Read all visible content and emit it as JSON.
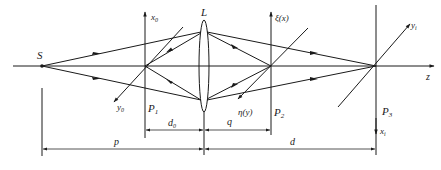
{
  "figure": {
    "labels": {
      "source": "S",
      "lens": "L",
      "optical_axis": "z",
      "p1_plane": "P",
      "p1_sub": "1",
      "p2_plane": "P",
      "p2_sub": "2",
      "p3_plane": "P",
      "p3_sub": "3",
      "x0_axis": "x",
      "x0_sub": "0",
      "y0_axis": "y",
      "y0_sub": "0",
      "xi_axis": "ξ(x)",
      "eta_axis": "η(y)",
      "xi_image_axis": "x",
      "xi_image_sub": "i",
      "yi_image_axis": "y",
      "yi_image_sub": "i"
    },
    "dimensions": {
      "d0": "d",
      "d0_sub": "0",
      "q": "q",
      "p": "p",
      "d": "d"
    },
    "colors": {
      "ink": "#1a1a1a",
      "background": "#ffffff"
    }
  }
}
